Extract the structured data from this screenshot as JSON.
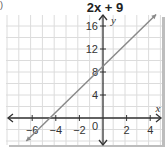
{
  "chart_data": {
    "type": "line",
    "title": "2x + 9",
    "xlabel": "x",
    "ylabel": "y",
    "xlim": [
      -8,
      4.7
    ],
    "ylim": [
      -4.5,
      18
    ],
    "grid": true,
    "x_ticks": [
      -6,
      -4,
      -2,
      2,
      4
    ],
    "y_ticks": [
      4,
      8,
      12,
      16
    ],
    "origin_label": "0",
    "series": [
      {
        "name": "y = 2x + 9",
        "x": [
          -6.5,
          4.5
        ],
        "y": [
          -4,
          18
        ],
        "color": "#8a8a8a",
        "arrows": "both"
      }
    ]
  },
  "labels": {
    "title_expr": "2x + 9",
    "x_axis": "x",
    "y_axis": "y",
    "origin": "0",
    "corner_mark": ")"
  }
}
